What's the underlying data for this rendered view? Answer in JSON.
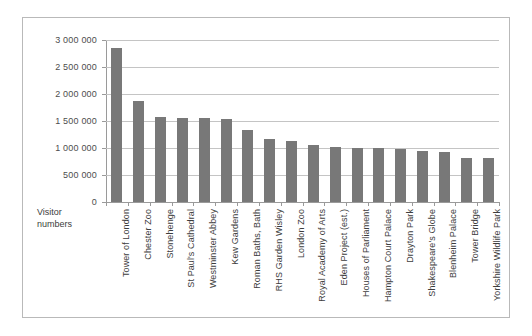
{
  "chart_data": {
    "type": "bar",
    "title": "",
    "subtitle": "",
    "xlabel": "",
    "ylabel": "Visitor numbers",
    "ylabel_line1": "Visitor",
    "ylabel_line2": "numbers",
    "ylim": [
      0,
      3000000
    ],
    "ytick_step": 500000,
    "grid": true,
    "legend": "none",
    "bar_color": "#787878",
    "gridline_color": "#c4c4c4",
    "axis_color": "#9a9a9a",
    "ytick_labels": [
      "3 000 000",
      "2 500 000",
      "2 000 000",
      "1 500 000",
      "1 000 000",
      "500 000",
      "0"
    ],
    "ytick_values": [
      3000000,
      2500000,
      2000000,
      1500000,
      1000000,
      500000,
      0
    ],
    "categories": [
      "Tower of London",
      "Chester Zoo",
      "Stonehenge",
      "St Paul's Cathedral",
      "Westminster Abbey",
      "Kew Gardens",
      "Roman Baths, Bath",
      "RHS Garden Wisley",
      "London Zoo",
      "Royal Academy of Arts",
      "Eden Project (est.)",
      "Houses of Parliament",
      "Hampton Court Palace",
      "Drayton Park",
      "Shakespeare's Globe",
      "Blenheim Palace",
      "Tower Bridge",
      "Yorkshire Wildlife Park"
    ],
    "values": [
      2850000,
      1870000,
      1580000,
      1560000,
      1550000,
      1540000,
      1330000,
      1160000,
      1130000,
      1050000,
      1010000,
      1000000,
      1000000,
      980000,
      950000,
      930000,
      820000,
      810000
    ]
  }
}
